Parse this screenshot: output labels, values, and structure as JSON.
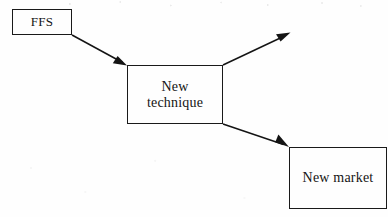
{
  "diagram": {
    "type": "flow-diagram",
    "title": "",
    "background_color": "#fefefe",
    "stroke_color": "#141414",
    "nodes": [
      {
        "id": "ffs",
        "label": "FFS",
        "shape": "rectangle",
        "x": 12,
        "y": 9,
        "width": 60,
        "height": 26
      },
      {
        "id": "new_technique",
        "label": "New\ntechnique",
        "shape": "rectangle",
        "x": 127,
        "y": 65,
        "width": 96,
        "height": 59
      },
      {
        "id": "new_market",
        "label": "New market",
        "shape": "rectangle",
        "x": 289,
        "y": 147,
        "width": 98,
        "height": 62
      }
    ],
    "edges": [
      {
        "id": "ffs-to-new-technique",
        "from": "ffs",
        "to": "new_technique",
        "label": "",
        "arrowhead": "filled-triangle",
        "x1": 72,
        "y1": 35,
        "x2": 127,
        "y2": 65
      },
      {
        "id": "new-technique-to-open-1",
        "from": "new_technique",
        "to": "",
        "label": "",
        "arrowhead": "filled-triangle",
        "x1": 223,
        "y1": 65,
        "x2": 290,
        "y2": 33
      },
      {
        "id": "new-technique-to-new-market",
        "from": "new_technique",
        "to": "new_market",
        "label": "",
        "arrowhead": "filled-triangle",
        "x1": 223,
        "y1": 124,
        "x2": 289,
        "y2": 147
      }
    ]
  }
}
